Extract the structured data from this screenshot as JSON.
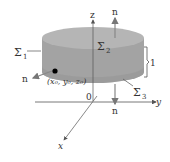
{
  "diagram": {
    "type": "cylinder-surface-normals",
    "colors": {
      "cylinder_side": "#a3a3a3",
      "cylinder_top": "#b4b4b4",
      "cylinder_bottom_shade": "#959595",
      "axes": "#555555",
      "arrows": "#888888",
      "point": "#000000"
    },
    "labels": {
      "z_axis": "z",
      "y_axis": "y",
      "x_axis": "x",
      "origin": "0",
      "sigma1": "Σ",
      "sigma1_sub": "1",
      "sigma2": "Σ",
      "sigma2_sub": "2",
      "sigma3": "Σ",
      "sigma3_sub": "3",
      "normal_top": "n",
      "normal_bottom": "n",
      "normal_side": "n",
      "height": "1",
      "point": "(x₀, y₀, z₀)"
    }
  }
}
